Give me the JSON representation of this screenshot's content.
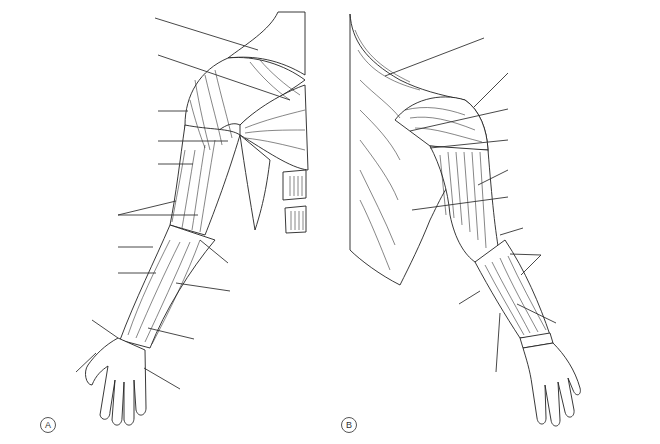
{
  "figure": {
    "panels": [
      {
        "id": "A",
        "label": "A",
        "view": "anterior arm and shoulder",
        "leader_lines": [
          {
            "x1": 155,
            "y1": 18,
            "x2": 258,
            "y2": 50
          },
          {
            "x1": 158,
            "y1": 55,
            "x2": 290,
            "y2": 100
          },
          {
            "x1": 158,
            "y1": 111,
            "x2": 188,
            "y2": 111
          },
          {
            "x1": 158,
            "y1": 141,
            "x2": 228,
            "y2": 141
          },
          {
            "x1": 158,
            "y1": 164,
            "x2": 193,
            "y2": 164
          },
          {
            "x1": 118,
            "y1": 215,
            "x2": 176,
            "y2": 201
          },
          {
            "x1": 118,
            "y1": 215,
            "x2": 198,
            "y2": 215
          },
          {
            "x1": 118,
            "y1": 247,
            "x2": 153,
            "y2": 247
          },
          {
            "x1": 118,
            "y1": 273,
            "x2": 156,
            "y2": 273
          },
          {
            "x1": 200,
            "y1": 240,
            "x2": 228,
            "y2": 263
          },
          {
            "x1": 176,
            "y1": 283,
            "x2": 230,
            "y2": 291
          },
          {
            "x1": 92,
            "y1": 320,
            "x2": 118,
            "y2": 338
          },
          {
            "x1": 148,
            "y1": 328,
            "x2": 194,
            "y2": 339
          },
          {
            "x1": 76,
            "y1": 372,
            "x2": 96,
            "y2": 353
          },
          {
            "x1": 144,
            "y1": 368,
            "x2": 180,
            "y2": 389
          }
        ]
      },
      {
        "id": "B",
        "label": "B",
        "view": "posterior arm and shoulder",
        "leader_lines": [
          {
            "x1": 385,
            "y1": 76,
            "x2": 484,
            "y2": 38
          },
          {
            "x1": 474,
            "y1": 107,
            "x2": 508,
            "y2": 73
          },
          {
            "x1": 410,
            "y1": 131,
            "x2": 508,
            "y2": 109
          },
          {
            "x1": 430,
            "y1": 148,
            "x2": 508,
            "y2": 140
          },
          {
            "x1": 478,
            "y1": 185,
            "x2": 508,
            "y2": 170
          },
          {
            "x1": 412,
            "y1": 210,
            "x2": 508,
            "y2": 197
          },
          {
            "x1": 500,
            "y1": 235,
            "x2": 523,
            "y2": 228
          },
          {
            "x1": 510,
            "y1": 254,
            "x2": 541,
            "y2": 255
          },
          {
            "x1": 521,
            "y1": 275,
            "x2": 541,
            "y2": 255
          },
          {
            "x1": 459,
            "y1": 304,
            "x2": 480,
            "y2": 291
          },
          {
            "x1": 517,
            "y1": 304,
            "x2": 556,
            "y2": 323
          },
          {
            "x1": 500,
            "y1": 313,
            "x2": 496,
            "y2": 372
          }
        ]
      }
    ],
    "labels_visible_text": []
  }
}
